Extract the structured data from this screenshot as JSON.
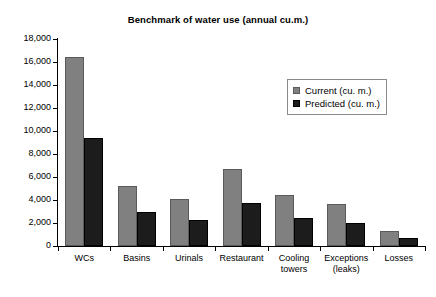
{
  "chart_data": {
    "type": "bar",
    "title": "Benchmark of water use (annual cu.m.)",
    "xlabel": "",
    "ylabel": "",
    "ylim": [
      0,
      18000
    ],
    "ytick_step": 2000,
    "grid": false,
    "legend_position": "upper right",
    "categories": [
      "WCs",
      "Basins",
      "Urinals",
      "Restaurant",
      "Cooling towers",
      "Exceptions (leaks)",
      "Losses"
    ],
    "series": [
      {
        "name": "Current (cu. m.)",
        "color": "#808080",
        "values": [
          16400,
          5200,
          4100,
          6700,
          4400,
          3650,
          1300
        ]
      },
      {
        "name": "Predicted (cu. m.)",
        "color": "#1c1c1c",
        "values": [
          9400,
          3000,
          2300,
          3750,
          2400,
          2000,
          700
        ]
      }
    ],
    "ytick_labels": [
      "18,000",
      "16,000",
      "14,000",
      "12,000",
      "10,000",
      "8,000",
      "6,000",
      "4,000",
      "2,000",
      "0"
    ],
    "category_label_lines": [
      [
        "WCs"
      ],
      [
        "Basins"
      ],
      [
        "Urinals"
      ],
      [
        "Restaurant"
      ],
      [
        "Cooling",
        "towers"
      ],
      [
        "Exceptions",
        "(leaks)"
      ],
      [
        "Losses"
      ]
    ]
  }
}
